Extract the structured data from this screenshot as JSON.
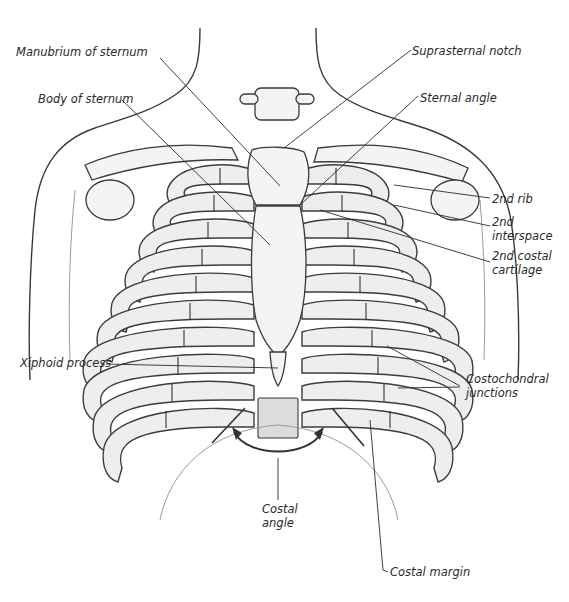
{
  "figure": {
    "labels": {
      "manubrium": "Manubrium of sternum",
      "body_of_sternum": "Body of sternum",
      "suprasternal_notch": "Suprasternal notch",
      "sternal_angle": "Sternal angle",
      "second_rib": "2nd rib",
      "second_interspace_line1": "2nd",
      "second_interspace_line2": "interspace",
      "second_costal_cartilage_line1": "2nd costal",
      "second_costal_cartilage_line2": "cartilage",
      "xiphoid": "Xiphoid process",
      "costochondral_line1": "Costochondral",
      "costochondral_line2": "junctions",
      "costal_angle_line1": "Costal",
      "costal_angle_line2": "angle",
      "costal_margin": "Costal margin"
    },
    "colors": {
      "ink": "#2a2a2a",
      "bone": "#f4f4f4",
      "shade": "#dcdcdc",
      "background": "#ffffff"
    }
  }
}
